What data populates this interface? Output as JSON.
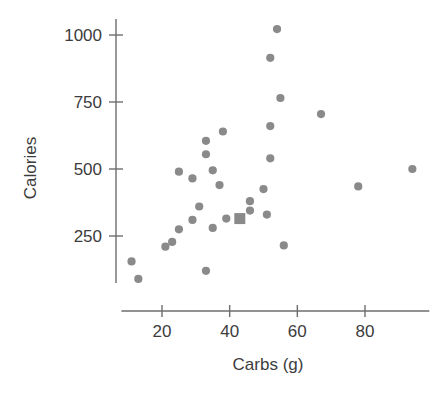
{
  "chart_data": {
    "type": "scatter",
    "title": "",
    "xlabel": "Carbs (g)",
    "ylabel": "Calories",
    "xticks": [
      20,
      40,
      60,
      80
    ],
    "yticks": [
      250,
      500,
      750,
      1000
    ],
    "xtick_labels": [
      "20",
      "40",
      "60",
      "80"
    ],
    "ytick_labels": [
      "250",
      "500",
      "750",
      "1000"
    ],
    "xlim": [
      8,
      98
    ],
    "ylim": [
      60,
      1060
    ],
    "grid": false,
    "legend": null,
    "marker_color": "#8a8a8a",
    "axis_color": "#6e6e6e",
    "text_color": "#3c3c3c",
    "series": [
      {
        "name": "items",
        "marker": "circle",
        "points": [
          {
            "x": 11,
            "y": 155
          },
          {
            "x": 13,
            "y": 90
          },
          {
            "x": 21,
            "y": 210
          },
          {
            "x": 23,
            "y": 228
          },
          {
            "x": 25,
            "y": 275
          },
          {
            "x": 25,
            "y": 490
          },
          {
            "x": 29,
            "y": 310
          },
          {
            "x": 29,
            "y": 465
          },
          {
            "x": 31,
            "y": 360
          },
          {
            "x": 33,
            "y": 120
          },
          {
            "x": 33,
            "y": 555
          },
          {
            "x": 33,
            "y": 605
          },
          {
            "x": 35,
            "y": 280
          },
          {
            "x": 35,
            "y": 495
          },
          {
            "x": 37,
            "y": 440
          },
          {
            "x": 38,
            "y": 640
          },
          {
            "x": 39,
            "y": 315
          },
          {
            "x": 46,
            "y": 345
          },
          {
            "x": 46,
            "y": 380
          },
          {
            "x": 50,
            "y": 425
          },
          {
            "x": 51,
            "y": 330
          },
          {
            "x": 52,
            "y": 540
          },
          {
            "x": 52,
            "y": 660
          },
          {
            "x": 52,
            "y": 915
          },
          {
            "x": 54,
            "y": 1022
          },
          {
            "x": 55,
            "y": 765
          },
          {
            "x": 56,
            "y": 215
          },
          {
            "x": 67,
            "y": 705
          },
          {
            "x": 78,
            "y": 435
          },
          {
            "x": 94,
            "y": 500
          }
        ]
      },
      {
        "name": "highlighted",
        "marker": "square",
        "points": [
          {
            "x": 43,
            "y": 315
          }
        ]
      }
    ]
  }
}
